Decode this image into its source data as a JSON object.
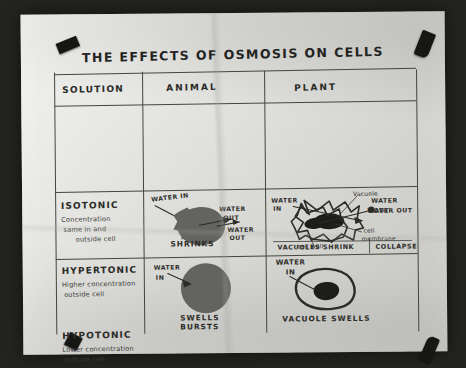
{
  "poster": {
    "title": "THE EFFECTS OF OSMOSIS ON CELLS",
    "medium": "hand-drawn marker poster photograph",
    "paper_color": "#cfcfca",
    "ink_color": "#2b2b28",
    "tape_color": "#161614"
  },
  "table": {
    "headers": [
      "SOLUTION",
      "ANIMAL",
      "PLANT"
    ],
    "rows": [
      {
        "solution": {
          "term": "ISOTONIC",
          "description_lines": [
            "Concentration",
            "same in and",
            "outside cell"
          ]
        },
        "animal": {
          "labels": [
            "WATER IN",
            "WATER OUT"
          ],
          "caption": "",
          "shape": "round-blob"
        },
        "plant": {
          "labels": [
            "WATER IN",
            "Vacuole",
            "WATER OUT",
            "cell membrane",
            "cell wall"
          ],
          "caption": "",
          "shape": "turgid-plant-cell"
        }
      },
      {
        "solution": {
          "term": "HYPERTONIC",
          "description_lines": [
            "Higher concentration",
            "outside cell"
          ]
        },
        "animal": {
          "labels": [
            "WATER OUT"
          ],
          "caption": "SHRINKS",
          "shape": "crenated-blob"
        },
        "plant": {
          "labels": [
            "WATER OUT"
          ],
          "caption": "VACUOLES SHRINK  COLLAPSE",
          "shape": "plasmolysed-plant-cell"
        }
      },
      {
        "solution": {
          "term": "HYPOTONIC",
          "description_lines": [
            "Lower concentration",
            "outside cell"
          ]
        },
        "animal": {
          "labels": [
            "WATER IN"
          ],
          "caption": "SWELLS\nBURSTS",
          "shape": "swollen-circle"
        },
        "plant": {
          "labels": [
            "WATER IN"
          ],
          "caption": "VACUOLE SWELLS",
          "shape": "swollen-plant-cell"
        }
      }
    ]
  },
  "labels": {
    "water_in": "WATER IN",
    "water_in_l1": "WATER",
    "water_in_l2": "IN",
    "water_out_l1": "WATER",
    "water_out_l2": "OUT",
    "vacuole": "Vacuole",
    "water_out": "WATER OUT",
    "cell_membrane_l1": "cell",
    "cell_membrane_l2": "membrane",
    "cell_wall": "cell wall",
    "shrinks": "SHRINKS",
    "vacuoles_shrink": "VACUOLES SHRINK",
    "collapse": "COLLAPSE",
    "swells": "SWELLS",
    "bursts": "BURSTS",
    "vacuole_swells": "VACUOLE SWELLS"
  }
}
